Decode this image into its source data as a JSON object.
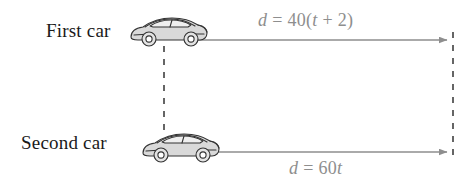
{
  "figure": {
    "background_color": "#ffffff"
  },
  "labels": {
    "first_car": "First car",
    "second_car": "Second car"
  },
  "equations": {
    "top": {
      "lhs": "d",
      "relation": "=",
      "rhs_prefix": "40(",
      "rhs_var": "t",
      "rhs_suffix": " + 2)",
      "full_text": "d = 40(t + 2)",
      "color": "#8e8e8e"
    },
    "bottom": {
      "lhs": "d",
      "relation": "=",
      "rhs_prefix": "60",
      "rhs_var": "t",
      "rhs_suffix": "",
      "full_text": "d = 60t",
      "color": "#8e8e8e"
    }
  },
  "icons": {
    "car_first": "sports-car-icon",
    "car_second": "sports-car-icon"
  },
  "graphics": {
    "arrow_color": "#8e8e8e",
    "dashed_line_color": "#333333",
    "car_body_fill": "#d9d9d9",
    "car_outline": "#333333",
    "car_window_fill": "#eeeeee",
    "arrow_top": {
      "x1": 195,
      "y1": 40,
      "x2": 449,
      "y2": 40
    },
    "arrow_bottom": {
      "x1": 207,
      "y1": 152,
      "x2": 449,
      "y2": 152
    },
    "dashed_left": {
      "x": 164,
      "y1": 46,
      "y2": 132
    },
    "dashed_right": {
      "x": 453,
      "y1": 32,
      "y2": 160
    }
  }
}
